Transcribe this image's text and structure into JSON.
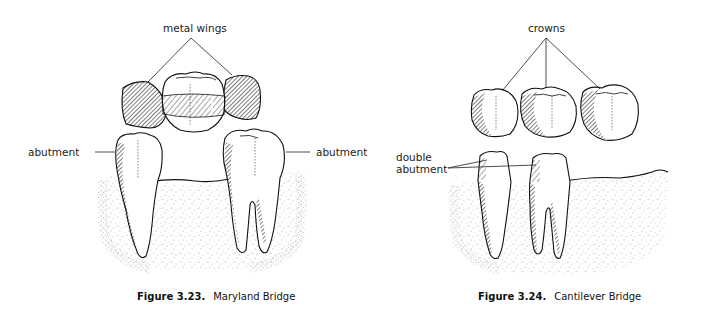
{
  "figures": [
    {
      "id": "maryland",
      "caption": {
        "number": "Figure 3.23.",
        "title": "Maryland Bridge"
      },
      "labels": {
        "top": "metal wings",
        "left": "abutment",
        "right": "abutment"
      }
    },
    {
      "id": "cantilever",
      "caption": {
        "number": "Figure 3.24.",
        "title": "Cantilever Bridge"
      },
      "labels": {
        "top": "crowns",
        "left_line1": "double",
        "left_line2": "abutment"
      }
    }
  ],
  "colors": {
    "ink": "#1a1a1a",
    "gum_stipple": "#6a6a6a",
    "background": "#ffffff"
  }
}
